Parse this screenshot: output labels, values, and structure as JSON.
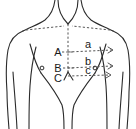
{
  "figure": {
    "background_color": "#ffffff",
    "outline_color": "#2b2b2b",
    "dashed_color": "#555555",
    "label_color": "#1a1a1a"
  },
  "labels": {
    "level_a": "A",
    "level_b": "B",
    "level_c": "C",
    "measure_a": "a",
    "measure_b": "b",
    "measure_c": "c"
  },
  "markers": {
    "left_nipple": "nipple-marker",
    "right_nipple": "nipple-marker"
  },
  "annotations": {
    "midline": "vertical-midline-dashed",
    "clavicle_line": "clavicle-dashed-line",
    "level_line_a": "horizontal-level-line-A",
    "level_line_b": "horizontal-level-line-B",
    "level_line_c": "horizontal-level-line-C"
  }
}
